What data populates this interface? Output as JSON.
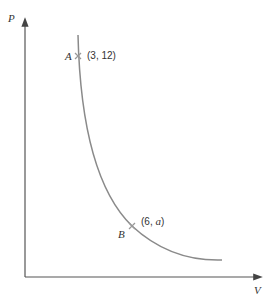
{
  "diagram": {
    "y_axis_label": "P",
    "x_axis_label": "V",
    "points": [
      {
        "name": "A",
        "coord": "(3, 12)"
      },
      {
        "name": "B",
        "coord_prefix": "(6, ",
        "coord_var": "a",
        "coord_suffix": ")"
      }
    ],
    "colors": {
      "axis": "#555555",
      "curve": "#8a8a8a",
      "marker": "#9a9a9a",
      "text": "#333333"
    }
  }
}
